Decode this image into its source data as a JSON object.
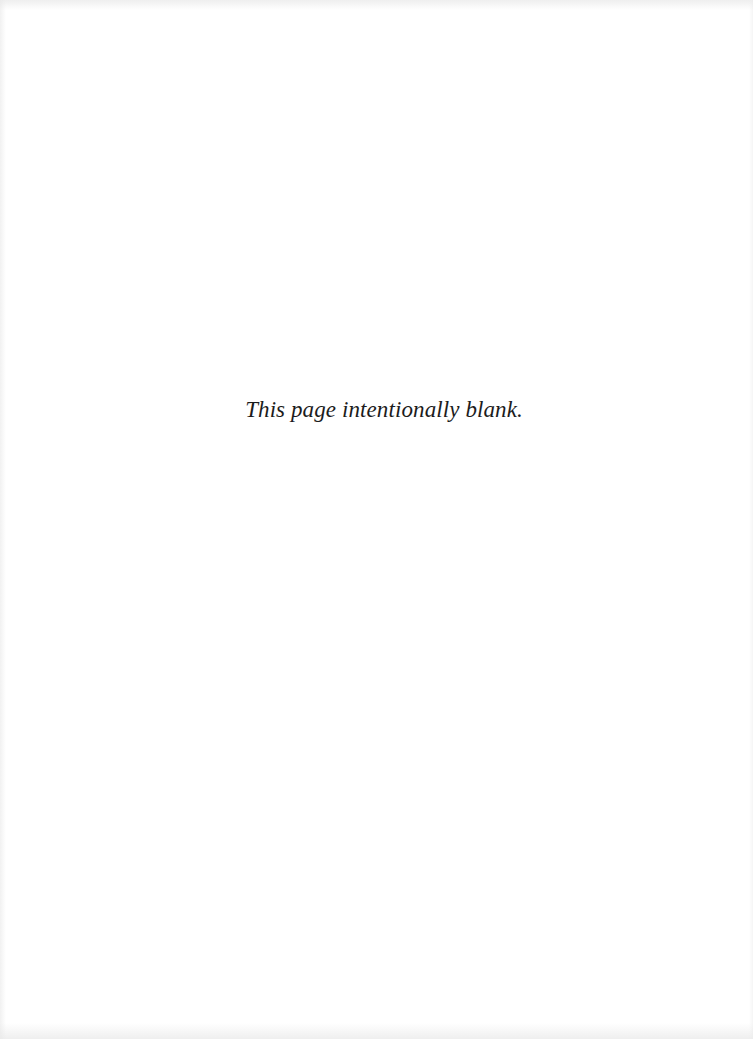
{
  "page": {
    "notice_text": "This page intentionally blank.",
    "colors": {
      "background": "#ffffff",
      "text": "#1c1c1c"
    }
  }
}
